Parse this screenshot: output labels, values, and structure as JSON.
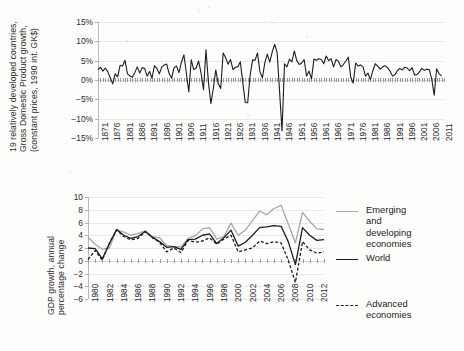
{
  "figure": {
    "background_color": "#fdfdfc",
    "ink_color": "#1d1d1d",
    "grey_series_color": "#a8a8a8"
  },
  "top_panel": {
    "y_axis_title": "19 relatively developed countries, Gross Domestic Product growth, (constant prices, 1990 int. GK$)",
    "y_axis_title_line1": "19 relatively developed countries,",
    "y_axis_title_line2": "Gross Domestic Product growth,",
    "y_axis_title_line3": "(constant prices, 1990 int. GK$)",
    "y_tick_labels": [
      "15%",
      "10%",
      "5%",
      "0%",
      "-5%",
      "-10%",
      "-15%"
    ],
    "x_tick_labels": [
      "1871",
      "1876",
      "1881",
      "1886",
      "1891",
      "1896",
      "1901",
      "1906",
      "1911",
      "1916",
      "1921",
      "1926",
      "1931",
      "1936",
      "1941",
      "1946",
      "1951",
      "1956",
      "1961",
      "1966",
      "1971",
      "1976",
      "1981",
      "1986",
      "1991",
      "1996",
      "2001",
      "2006",
      "2011"
    ]
  },
  "bottom_panel": {
    "y_axis_title": "GDP growth, annual percentage change",
    "y_axis_title_line1": "GDP growth, annual",
    "y_axis_title_line2": "percentage change",
    "y_tick_labels": [
      "10",
      "8",
      "6",
      "4",
      "2",
      "0",
      "-2",
      "-4",
      "-6"
    ],
    "x_tick_labels": [
      "1980",
      "1982",
      "1984",
      "1986",
      "1988",
      "1990",
      "1992",
      "1994",
      "1996",
      "1998",
      "2000",
      "2002",
      "2004",
      "2006",
      "2008",
      "2010",
      "2012"
    ],
    "legend": [
      {
        "label": "Emerging and\ndeveloping economies",
        "style": "solid-grey",
        "color": "#a8a8a8"
      },
      {
        "label": "World",
        "style": "solid-dark",
        "color": "#1d1d1d"
      },
      {
        "label": "Advanced economies",
        "style": "dashed-dark",
        "color": "#1d1d1d"
      }
    ]
  },
  "chart_data": [
    {
      "type": "line",
      "id": "top-chart",
      "title": "",
      "xlabel": "",
      "ylabel": "19 relatively developed countries, Gross Domestic Product growth, (constant prices, 1990 int. GK$)",
      "xlim": [
        1871,
        2012
      ],
      "ylim": [
        -15,
        15
      ],
      "ytick_values": [
        15,
        10,
        5,
        0,
        -5,
        -10,
        -15
      ],
      "ytick_format": "percent",
      "grid": true,
      "legend": "none",
      "x": [
        1871,
        1872,
        1873,
        1874,
        1875,
        1876,
        1877,
        1878,
        1879,
        1880,
        1881,
        1882,
        1883,
        1884,
        1885,
        1886,
        1887,
        1888,
        1889,
        1890,
        1891,
        1892,
        1893,
        1894,
        1895,
        1896,
        1897,
        1898,
        1899,
        1900,
        1901,
        1902,
        1903,
        1904,
        1905,
        1906,
        1907,
        1908,
        1909,
        1910,
        1911,
        1912,
        1913,
        1914,
        1915,
        1916,
        1917,
        1918,
        1919,
        1920,
        1921,
        1922,
        1923,
        1924,
        1925,
        1926,
        1927,
        1928,
        1929,
        1930,
        1931,
        1932,
        1933,
        1934,
        1935,
        1936,
        1937,
        1938,
        1939,
        1940,
        1941,
        1942,
        1943,
        1944,
        1945,
        1946,
        1947,
        1948,
        1949,
        1950,
        1951,
        1952,
        1953,
        1954,
        1955,
        1956,
        1957,
        1958,
        1959,
        1960,
        1961,
        1962,
        1963,
        1964,
        1965,
        1966,
        1967,
        1968,
        1969,
        1970,
        1971,
        1972,
        1973,
        1974,
        1975,
        1976,
        1977,
        1978,
        1979,
        1980,
        1981,
        1982,
        1983,
        1984,
        1985,
        1986,
        1987,
        1988,
        1989,
        1990,
        1991,
        1992,
        1993,
        1994,
        1995,
        1996,
        1997,
        1998,
        1999,
        2000,
        2001,
        2002,
        2003,
        2004,
        2005,
        2006,
        2007,
        2008,
        2009,
        2010,
        2011,
        2012
      ],
      "series": [
        {
          "name": "19 relatively developed countries GDP growth",
          "color": "#1d1d1d",
          "style": "solid",
          "values": [
            2.6,
            3.3,
            2.3,
            3.1,
            2.1,
            0.6,
            -1.0,
            1.6,
            0.8,
            3.8,
            3.6,
            5.1,
            1.6,
            1.1,
            0.7,
            1.9,
            3.4,
            1.8,
            3.2,
            3.0,
            1.0,
            2.2,
            0.5,
            3.7,
            3.0,
            1.6,
            3.4,
            3.9,
            4.1,
            1.6,
            0.5,
            3.2,
            3.6,
            1.9,
            4.6,
            6.5,
            1.8,
            -3.1,
            5.2,
            2.7,
            3.1,
            4.9,
            1.8,
            -2.5,
            7.8,
            -0.6,
            -6.1,
            -2.2,
            2.6,
            -1.0,
            -2.2,
            7.0,
            5.8,
            4.1,
            5.3,
            2.7,
            3.3,
            3.4,
            4.7,
            -0.6,
            -5.8,
            -5.9,
            1.3,
            5.2,
            5.1,
            7.0,
            2.1,
            0.6,
            4.5,
            6.7,
            4.6,
            7.3,
            9.2,
            7.1,
            -3.0,
            -13.2,
            4.2,
            3.4,
            5.4,
            4.7,
            7.5,
            5.0,
            4.0,
            4.4,
            5.3,
            1.0,
            2.3,
            0.3,
            5.4,
            5.1,
            5.5,
            5.3,
            4.2,
            6.2,
            5.0,
            5.5,
            3.4,
            5.3,
            4.8,
            3.4,
            4.0,
            4.9,
            5.9,
            0.7,
            -0.8,
            4.4,
            3.6,
            3.9,
            3.4,
            1.0,
            1.8,
            0.1,
            2.4,
            4.2,
            3.6,
            2.8,
            3.4,
            3.7,
            3.2,
            2.3,
            1.0,
            1.4,
            2.4,
            3.0,
            2.6,
            3.3,
            3.1,
            2.4,
            3.2,
            1.3,
            1.4,
            2.1,
            3.0,
            2.5,
            2.8,
            2.7,
            0.2,
            -3.9,
            2.9,
            1.6,
            1.1
          ]
        }
      ]
    },
    {
      "type": "line",
      "id": "bottom-chart",
      "title": "",
      "xlabel": "",
      "ylabel": "GDP growth, annual percentage change",
      "xlim": [
        1980,
        2013
      ],
      "ylim": [
        -6,
        10
      ],
      "ytick_values": [
        10,
        8,
        6,
        4,
        2,
        0,
        -2,
        -4,
        -6
      ],
      "ytick_format": "number",
      "grid": true,
      "legend": "right",
      "x": [
        1980,
        1981,
        1982,
        1983,
        1984,
        1985,
        1986,
        1987,
        1988,
        1989,
        1990,
        1991,
        1992,
        1993,
        1994,
        1995,
        1996,
        1997,
        1998,
        1999,
        2000,
        2001,
        2002,
        2003,
        2004,
        2005,
        2006,
        2007,
        2008,
        2009,
        2010,
        2011,
        2012,
        2013
      ],
      "series": [
        {
          "name": "Emerging and developing economies",
          "color": "#a8a8a8",
          "style": "solid",
          "values": [
            3.7,
            2.6,
            1.8,
            2.0,
            4.9,
            4.5,
            4.0,
            4.3,
            4.7,
            3.8,
            3.6,
            2.4,
            2.2,
            2.2,
            3.5,
            3.9,
            5.0,
            5.2,
            3.4,
            3.8,
            5.9,
            4.0,
            4.8,
            6.3,
            7.8,
            7.2,
            8.2,
            8.7,
            5.8,
            2.8,
            7.6,
            6.2,
            5.0,
            4.9
          ]
        },
        {
          "name": "World",
          "color": "#1d1d1d",
          "style": "solid",
          "values": [
            2.0,
            1.9,
            0.3,
            2.7,
            4.9,
            4.0,
            3.5,
            3.8,
            4.6,
            3.7,
            3.0,
            2.1,
            2.2,
            1.8,
            3.3,
            3.4,
            4.0,
            4.2,
            2.7,
            3.6,
            4.8,
            2.3,
            2.9,
            4.0,
            5.2,
            5.3,
            5.5,
            5.4,
            3.0,
            -0.6,
            5.2,
            4.0,
            3.2,
            3.3
          ]
        },
        {
          "name": "Advanced economies",
          "color": "#1d1d1d",
          "style": "dashed",
          "values": [
            0.2,
            1.6,
            0.1,
            2.8,
            4.8,
            3.8,
            3.3,
            3.5,
            4.6,
            3.6,
            2.9,
            1.4,
            2.0,
            1.3,
            3.2,
            2.9,
            3.1,
            3.6,
            2.6,
            3.4,
            4.0,
            1.4,
            1.7,
            2.0,
            3.1,
            2.7,
            3.0,
            2.8,
            0.1,
            -3.4,
            3.0,
            1.7,
            1.2,
            1.4
          ]
        }
      ]
    }
  ]
}
